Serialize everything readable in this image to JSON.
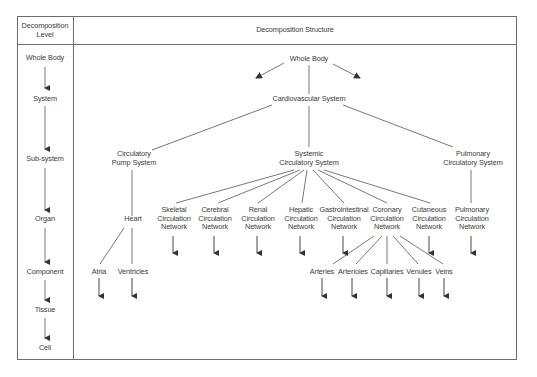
{
  "header": {
    "level_col": "Decomposition Level",
    "level_col_lines": [
      "Decomposition",
      "Level"
    ],
    "structure_col": "Decomposition Structure"
  },
  "levels": [
    "Whole Body",
    "System",
    "Sub-system",
    "Organ",
    "Component",
    "Tissue",
    "Cell"
  ],
  "nodes": {
    "whole_body": "Whole Body",
    "cardiovascular": "Cardiovascular System",
    "pump": [
      "Circulatory",
      "Pump System"
    ],
    "systemic": [
      "Systemic",
      "Circulatory System"
    ],
    "pulmonary_sys": [
      "Pulmonary",
      "Circulatory System"
    ],
    "heart": "Heart",
    "skeletal": [
      "Skeletal",
      "Circulation",
      "Network"
    ],
    "cerebral": [
      "Cerebral",
      "Circulation",
      "Network"
    ],
    "renal": [
      "Renal",
      "Circulation",
      "Network"
    ],
    "hepatic": [
      "Hepatic",
      "Circulation",
      "Network"
    ],
    "gastro": [
      "Gastrointestinal",
      "Circulation",
      "Network"
    ],
    "coronary": [
      "Coronary",
      "Circulation",
      "Network"
    ],
    "cutaneous": [
      "Cutaneous",
      "Circulation",
      "Network"
    ],
    "pulmonary_net": [
      "Pulmonary",
      "Circulation",
      "Network"
    ],
    "atria": "Atria",
    "ventricles": "Ventricles",
    "arteries": "Arteries",
    "arterioles": "Arterioles",
    "capillaries": "Capillaries",
    "venules": "Venules",
    "veins": "Veins"
  },
  "colors": {
    "line": "#555555",
    "border": "#6d6d6d",
    "text": "#3c3c3c"
  }
}
